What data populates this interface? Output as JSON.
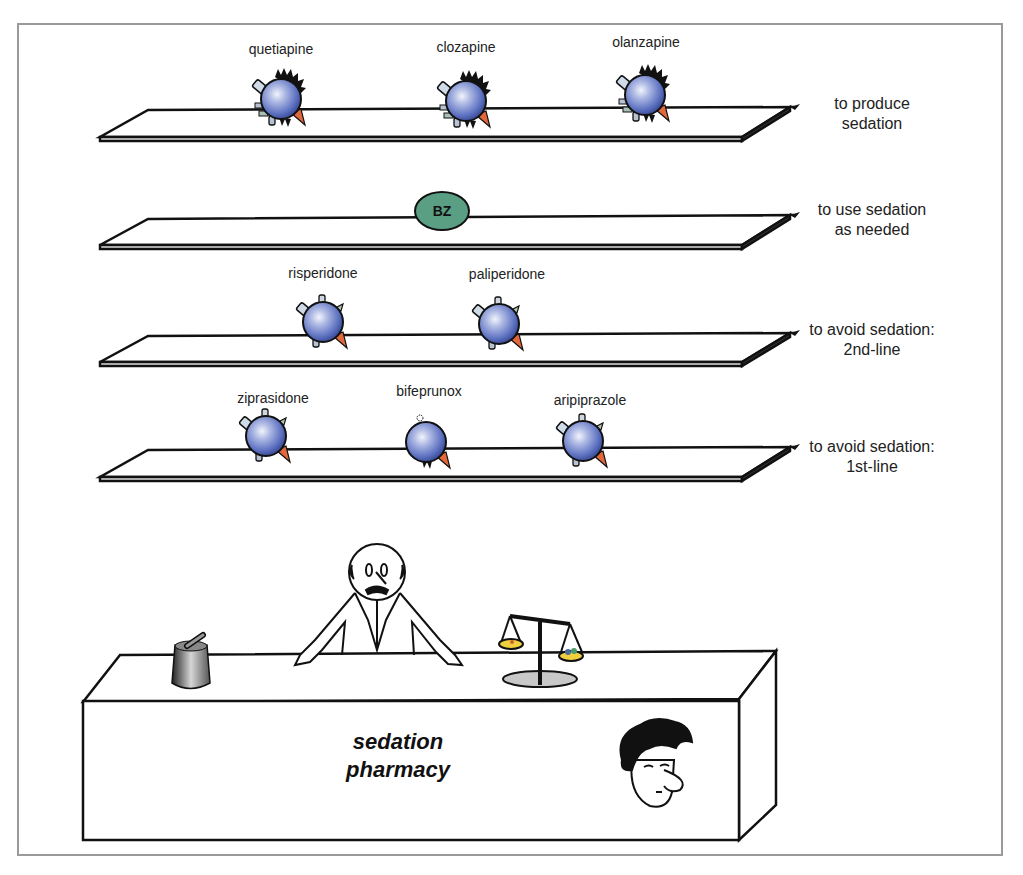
{
  "diagram": {
    "shelves": [
      {
        "label": "to produce sedation",
        "label_lines": [
          "to produce",
          "sedation"
        ],
        "drugs": [
          "quetiapine",
          "clozapine",
          "olanzapine"
        ]
      },
      {
        "label": "to use sedation as needed",
        "label_lines": [
          "to use sedation",
          "as needed"
        ],
        "drugs": [
          "BZ"
        ]
      },
      {
        "label": "to avoid sedation: 2nd-line",
        "label_lines": [
          "to avoid sedation:",
          "2nd-line"
        ],
        "drugs": [
          "risperidone",
          "paliperidone"
        ]
      },
      {
        "label": "to avoid sedation: 1st-line",
        "label_lines": [
          "to avoid sedation:",
          "1st-line"
        ],
        "drugs": [
          "ziprasidone",
          "bifeprunox",
          "aripiprazole"
        ]
      }
    ],
    "counter": {
      "label_lines": [
        "sedation",
        "pharmacy"
      ]
    },
    "icons": [
      "drug-molecule-icon",
      "benzodiazepine-pill-icon",
      "pharmacist-figure",
      "mortar-pestle-icon",
      "balance-scale-icon",
      "sleepy-patient-face"
    ],
    "colors": {
      "molecule_blue": "#5b6fbf",
      "bz_green": "#5a9e84",
      "orange_spike": "#e0683a",
      "frame_gray": "#9a9a9a",
      "scale_yellow": "#f0d040"
    }
  }
}
